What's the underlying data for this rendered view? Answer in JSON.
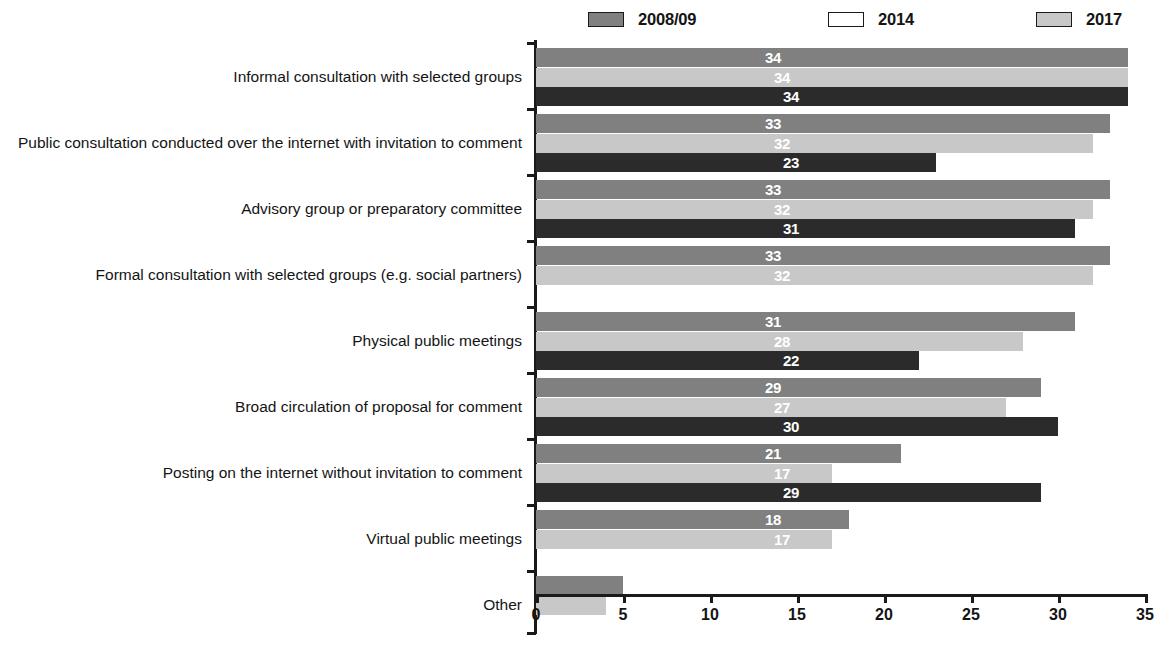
{
  "legend": {
    "position": "top",
    "items": [
      {
        "label": "2008/09",
        "swatch": "legend-swatch-2008-09",
        "color": "#808080"
      },
      {
        "label": "2014",
        "swatch": "legend-swatch-2014",
        "color": "#ffffff"
      },
      {
        "label": "2017",
        "swatch": "legend-swatch-2017",
        "color": "#c8c8c8"
      }
    ]
  },
  "chart_data": {
    "type": "bar",
    "orientation": "horizontal",
    "title": "",
    "subtitle": "",
    "xlabel": "",
    "ylabel": "",
    "xlim": [
      0,
      35
    ],
    "xticks": [
      0,
      5,
      10,
      15,
      20,
      25,
      30,
      35
    ],
    "xtick_labels": [
      "0",
      "5",
      "10",
      "15",
      "20",
      "25",
      "30",
      "35"
    ],
    "grid": false,
    "legend_position": "top",
    "categories": [
      "Informal consultation with selected groups",
      "Public consultation conducted over the internet with invitation to comment",
      "Advisory group or preparatory committee",
      "Formal consultation with selected groups (e.g. social partners)",
      "Physical public meetings",
      "Broad circulation of proposal for comment",
      "Posting on the internet without invitation to comment",
      "Virtual public meetings",
      "Other"
    ],
    "series": [
      {
        "name": "2017",
        "color": "#808080",
        "values": [
          34,
          33,
          33,
          33,
          31,
          29,
          21,
          18,
          5
        ],
        "labels": [
          "34",
          "33",
          "33",
          "33",
          "31",
          "29",
          "21",
          "18",
          "5"
        ]
      },
      {
        "name": "2014",
        "color": "#c8c8c8",
        "values": [
          34,
          32,
          32,
          32,
          28,
          27,
          17,
          17,
          4
        ],
        "labels": [
          "34",
          "32",
          "32",
          "32",
          "28",
          "27",
          "17",
          "17",
          "4"
        ]
      },
      {
        "name": "2008/09",
        "color": "#2b2b2b",
        "values": [
          34,
          23,
          31,
          null,
          22,
          30,
          29,
          null,
          null
        ],
        "labels": [
          "34",
          "23",
          "31",
          "",
          "22",
          "30",
          "29",
          "",
          ""
        ]
      }
    ]
  }
}
